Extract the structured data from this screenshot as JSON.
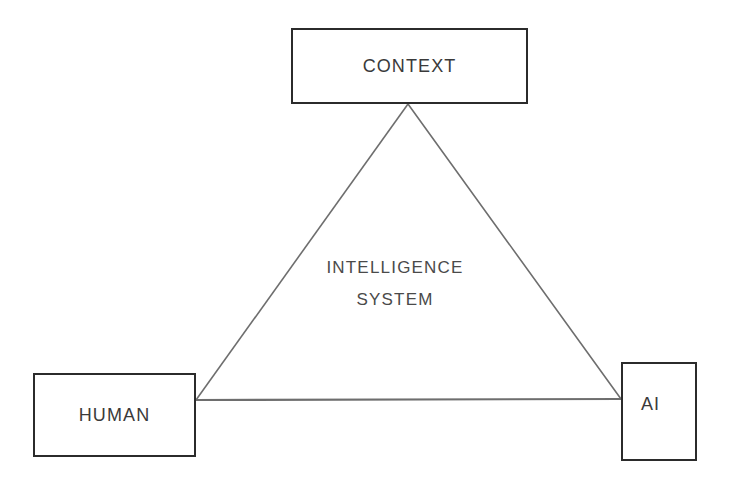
{
  "diagram": {
    "background_color": "#ffffff",
    "box_border_color": "#2b2b2b",
    "edge_color": "#6e6e6e",
    "text_color": "#3a3a3a",
    "nodes": [
      {
        "id": "context",
        "label": "CONTEXT",
        "x": 291,
        "y": 28,
        "width": 237,
        "height": 76
      },
      {
        "id": "human",
        "label": "HUMAN",
        "x": 33,
        "y": 373,
        "width": 163,
        "height": 84
      },
      {
        "id": "ai",
        "label": "AI",
        "x": 621,
        "y": 362,
        "width": 76,
        "height": 99
      }
    ],
    "center_caption": {
      "line1": "INTELLIGENCE",
      "line2": "SYSTEM"
    },
    "edges": [
      {
        "id": "context-human",
        "from": "context",
        "to": "human",
        "x1": 408,
        "y1": 104,
        "x2": 196,
        "y2": 400
      },
      {
        "id": "context-ai",
        "from": "context",
        "to": "ai",
        "x1": 408,
        "y1": 104,
        "x2": 621,
        "y2": 399
      },
      {
        "id": "human-ai",
        "from": "human",
        "to": "ai",
        "x1": 196,
        "y1": 400,
        "x2": 621,
        "y2": 399
      }
    ]
  }
}
